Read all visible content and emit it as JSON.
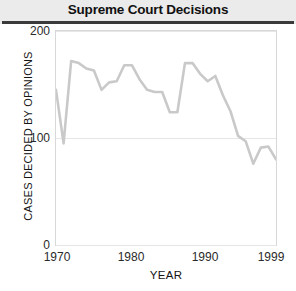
{
  "header": {
    "title": "Supreme Court Decisions",
    "rule_color": "#3b3b3b",
    "band_color": "#ebebeb"
  },
  "axis": {
    "y_ticks": [
      "200",
      "100",
      "0"
    ],
    "x_ticks": [
      "1970",
      "1980",
      "1990",
      "1999"
    ],
    "y_title": "CASES DECIDED BY OPINIONS",
    "x_title": "YEAR"
  },
  "style": {
    "line_color": "#c9c9c9",
    "grid_color": "#e6e6e6",
    "frame_color": "#d8d8d8",
    "plot_background": "#ffffff"
  },
  "chart_data": {
    "type": "line",
    "title": "Supreme Court Decisions",
    "subtitle": "",
    "xlabel": "YEAR",
    "ylabel": "CASES DECIDED BY OPINIONS",
    "xlim": [
      1970,
      1999
    ],
    "ylim": [
      0,
      200
    ],
    "xticks": [
      1970,
      1980,
      1990,
      1999
    ],
    "yticks": [
      0,
      100,
      200
    ],
    "grid": "horizontal",
    "legend": "none",
    "annotations": [],
    "x": [
      1970,
      1971,
      1972,
      1973,
      1974,
      1975,
      1976,
      1977,
      1978,
      1979,
      1980,
      1981,
      1982,
      1983,
      1984,
      1985,
      1986,
      1987,
      1988,
      1989,
      1990,
      1991,
      1992,
      1993,
      1994,
      1995,
      1996,
      1997,
      1998,
      1999
    ],
    "series": [
      {
        "name": "Cases decided by opinions",
        "values": [
          145,
          95,
          172,
          170,
          165,
          163,
          145,
          152,
          153,
          168,
          168,
          155,
          145,
          143,
          143,
          124,
          124,
          170,
          170,
          160,
          153,
          158,
          140,
          125,
          102,
          97,
          76,
          91,
          92,
          80
        ]
      }
    ]
  }
}
